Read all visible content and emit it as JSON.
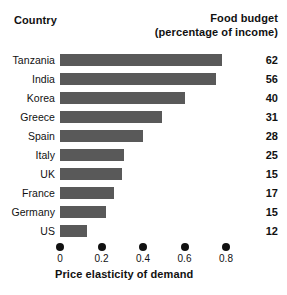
{
  "header": {
    "country_label": "Country",
    "budget_label_line1": "Food budget",
    "budget_label_line2": "(percentage of income)"
  },
  "axis": {
    "title": "Price elasticity of demand",
    "ticks": [
      "0",
      "0.2",
      "0.4",
      "0.6",
      "0.8"
    ]
  },
  "colors": {
    "bar": "#595959",
    "text": "#111111",
    "background": "#ffffff"
  },
  "rows": [
    {
      "country": "Tanzania",
      "elasticity": 0.78,
      "budget": "62"
    },
    {
      "country": "India",
      "elasticity": 0.75,
      "budget": "56"
    },
    {
      "country": "Korea",
      "elasticity": 0.6,
      "budget": "40"
    },
    {
      "country": "Greece",
      "elasticity": 0.49,
      "budget": "31"
    },
    {
      "country": "Spain",
      "elasticity": 0.4,
      "budget": "28"
    },
    {
      "country": "Italy",
      "elasticity": 0.31,
      "budget": "25"
    },
    {
      "country": "UK",
      "elasticity": 0.3,
      "budget": "15"
    },
    {
      "country": "France",
      "elasticity": 0.26,
      "budget": "17"
    },
    {
      "country": "Germany",
      "elasticity": 0.22,
      "budget": "15"
    },
    {
      "country": "US",
      "elasticity": 0.13,
      "budget": "12"
    }
  ],
  "chart_data": {
    "type": "bar",
    "orientation": "horizontal",
    "title": "",
    "xlabel": "Price elasticity of demand",
    "ylabel": "Country",
    "categories": [
      "Tanzania",
      "India",
      "Korea",
      "Greece",
      "Spain",
      "Italy",
      "UK",
      "France",
      "Germany",
      "US"
    ],
    "values": [
      0.78,
      0.75,
      0.6,
      0.49,
      0.4,
      0.31,
      0.3,
      0.26,
      0.22,
      0.13
    ],
    "xlim": [
      0,
      0.9
    ],
    "xticks": [
      0,
      0.2,
      0.4,
      0.6,
      0.8
    ],
    "xtick_labels": [
      "0",
      "0.2",
      "0.4",
      "0.6",
      "0.8"
    ],
    "grid": false,
    "legend": false,
    "series": [
      {
        "name": "Price elasticity of demand",
        "values": [
          0.78,
          0.75,
          0.6,
          0.49,
          0.4,
          0.31,
          0.3,
          0.26,
          0.22,
          0.13
        ]
      },
      {
        "name": "Food budget (percentage of income)",
        "values": [
          62,
          56,
          40,
          31,
          28,
          25,
          15,
          17,
          15,
          12
        ]
      }
    ],
    "annotations": {
      "right_column_header": "Food budget (percentage of income)",
      "right_column_values": [
        "62",
        "56",
        "40",
        "31",
        "28",
        "25",
        "15",
        "17",
        "15",
        "12"
      ]
    }
  }
}
